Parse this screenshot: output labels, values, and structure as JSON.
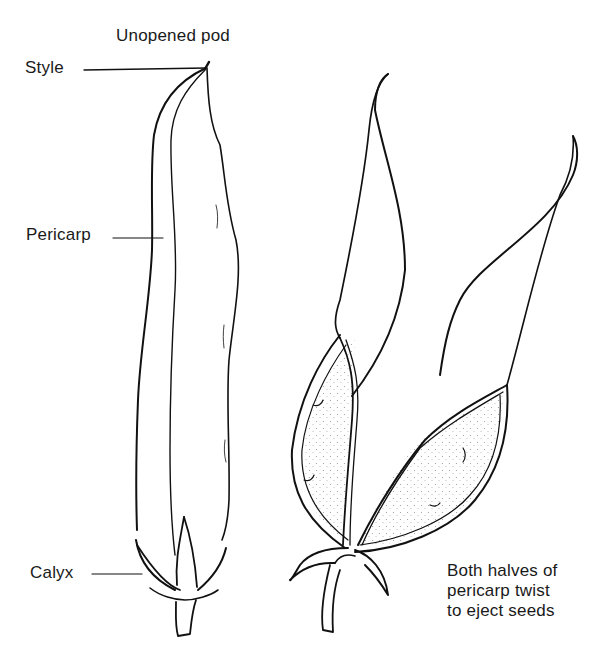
{
  "diagram": {
    "title": "Unopened pod",
    "labels": {
      "style": "Style",
      "pericarp": "Pericarp",
      "calyx": "Calyx"
    },
    "caption": {
      "lines": [
        "Both halves of",
        "pericarp twist",
        "to eject seeds"
      ]
    },
    "figures": [
      {
        "name": "unopened-pod",
        "parts": [
          "style",
          "pericarp",
          "calyx",
          "stalk"
        ]
      },
      {
        "name": "opened-pod",
        "parts": [
          "twisted-pericarp-halves",
          "seed-cavities",
          "calyx",
          "stalk"
        ]
      }
    ],
    "colors": {
      "ink": "#111111",
      "background": "#ffffff",
      "stipple": "#888888"
    }
  }
}
